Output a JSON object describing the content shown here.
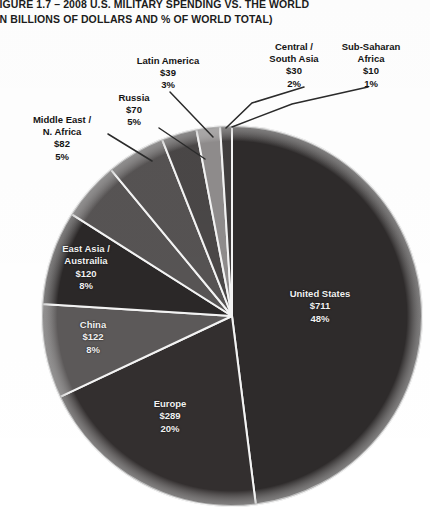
{
  "title": {
    "line1": "FIGURE 1.7 – 2008 U.S. MILITARY SPENDING VS. THE WORLD",
    "line2": "(IN BILLIONS OF DOLLARS AND % OF WORLD TOTAL)"
  },
  "chart_data": {
    "type": "pie",
    "title": "FIGURE 1.7 – 2008 U.S. MILITARY SPENDING VS. THE WORLD",
    "subtitle": "(IN BILLIONS OF DOLLARS AND % OF WORLD TOTAL)",
    "value_unit": "billions of dollars",
    "legend": "none",
    "grid": false,
    "start_angle_deg": 0,
    "direction": "clockwise",
    "slices": [
      {
        "name": "United States",
        "value": 711,
        "value_label": "$711",
        "percent": 48,
        "percent_label": "48%",
        "color": "#2e2b2b",
        "label_placement": "inside"
      },
      {
        "name": "Europe",
        "value": 289,
        "value_label": "$289",
        "percent": 20,
        "percent_label": "20%",
        "color": "#332f2f",
        "label_placement": "inside"
      },
      {
        "name": "China",
        "value": 122,
        "value_label": "$122",
        "percent": 8,
        "percent_label": "8%",
        "color": "#5c5959",
        "label_placement": "inside"
      },
      {
        "name": "East Asia / Austrailia",
        "name_line1": "East Asia /",
        "name_line2": "Austrailia",
        "value": 120,
        "value_label": "$120",
        "percent": 8,
        "percent_label": "8%",
        "color": "#2b2828",
        "label_placement": "inside"
      },
      {
        "name": "Middle East / N. Africa",
        "name_line1": "Middle East /",
        "name_line2": "N. Africa",
        "value": 82,
        "value_label": "$82",
        "percent": 5,
        "percent_label": "5%",
        "color": "#575454",
        "label_placement": "callout"
      },
      {
        "name": "Russia",
        "value": 70,
        "value_label": "$70",
        "percent": 5,
        "percent_label": "5%",
        "color": "#565353",
        "label_placement": "callout"
      },
      {
        "name": "Latin America",
        "value": 39,
        "value_label": "$39",
        "percent": 3,
        "percent_label": "3%",
        "color": "#4a4747",
        "label_placement": "callout"
      },
      {
        "name": "Central / South Asia",
        "name_line1": "Central /",
        "name_line2": "South Asia",
        "value": 30,
        "value_label": "$30",
        "percent": 2,
        "percent_label": "2%",
        "color": "#8f8c8c",
        "label_placement": "callout"
      },
      {
        "name": "Sub-Saharan Africa",
        "name_line1": "Sub-Saharan",
        "name_line2": "Africa",
        "value": 10,
        "value_label": "$10",
        "percent": 1,
        "percent_label": "1%",
        "color": "#413e3e",
        "label_placement": "callout"
      }
    ]
  },
  "colors": {
    "background": "#ffffff",
    "text": "#141414",
    "slice_label_text": "#f2f2f2",
    "divider": "#f4f4f4",
    "leader_line": "#2b2b2b"
  }
}
